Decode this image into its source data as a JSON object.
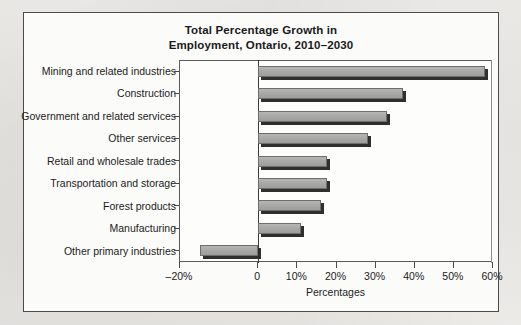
{
  "figure": {
    "title_line1": "Total Percentage Growth in",
    "title_line2": "Employment, Ontario, 2010–2030"
  },
  "chart_data": {
    "type": "bar",
    "orientation": "horizontal",
    "title": "Total Percentage Growth in Employment, Ontario, 2010–2030",
    "xlabel": "Percentages",
    "ylabel": "",
    "xlim": [
      -20,
      60
    ],
    "xticks": [
      -20,
      0,
      10,
      20,
      30,
      40,
      50,
      60
    ],
    "xtick_labels": [
      "–20%",
      "0",
      "10%",
      "20%",
      "30%",
      "40%",
      "50%",
      "60%"
    ],
    "grid": false,
    "legend": null,
    "categories": [
      "Mining and related industries",
      "Construction",
      "Government and related services",
      "Other services",
      "Retail and wholesale trades",
      "Transportation and storage",
      "Forest products",
      "Manufacturing",
      "Other primary industries"
    ],
    "values": [
      58,
      37,
      33,
      28,
      17.5,
      17.5,
      16,
      11,
      -15
    ],
    "bar_color": "#a9a9a7",
    "bar_edge_color": "#6e6e6c",
    "bar_shadow_color": "#2f2f2f"
  }
}
